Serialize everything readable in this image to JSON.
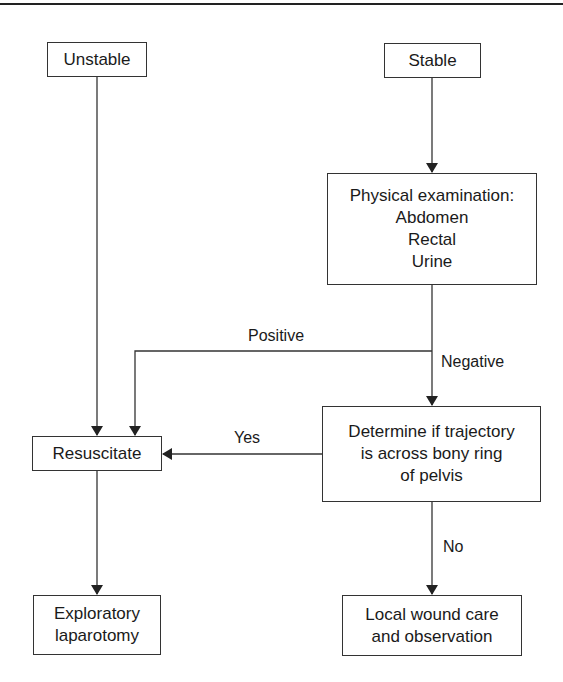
{
  "diagram": {
    "type": "flowchart",
    "nodes": {
      "unstable": {
        "lines": [
          "Unstable"
        ]
      },
      "stable": {
        "lines": [
          "Stable"
        ]
      },
      "physical_exam": {
        "lines": [
          "Physical examination:",
          "Abdomen",
          "Rectal",
          "Urine"
        ]
      },
      "resuscitate": {
        "lines": [
          "Resuscitate"
        ]
      },
      "determine": {
        "lines": [
          "Determine if trajectory",
          "is across bony ring",
          "of pelvis"
        ]
      },
      "exploratory": {
        "lines": [
          "Exploratory",
          "laparotomy"
        ]
      },
      "local_wound": {
        "lines": [
          "Local wound care",
          "and observation"
        ]
      }
    },
    "edge_labels": {
      "positive": "Positive",
      "negative": "Negative",
      "yes": "Yes",
      "no": "No"
    },
    "edges": [
      {
        "from": "Unstable",
        "to": "Resuscitate",
        "label": ""
      },
      {
        "from": "Stable",
        "to": "Physical examination",
        "label": ""
      },
      {
        "from": "Physical examination",
        "to": "Resuscitate",
        "label": "Positive"
      },
      {
        "from": "Physical examination",
        "to": "Determine if trajectory is across bony ring of pelvis",
        "label": "Negative"
      },
      {
        "from": "Determine if trajectory is across bony ring of pelvis",
        "to": "Resuscitate",
        "label": "Yes"
      },
      {
        "from": "Determine if trajectory is across bony ring of pelvis",
        "to": "Local wound care and observation",
        "label": "No"
      },
      {
        "from": "Resuscitate",
        "to": "Exploratory laparotomy",
        "label": ""
      }
    ],
    "colors": {
      "line": "#333333",
      "text": "#1a1a1a",
      "background": "#ffffff"
    }
  }
}
